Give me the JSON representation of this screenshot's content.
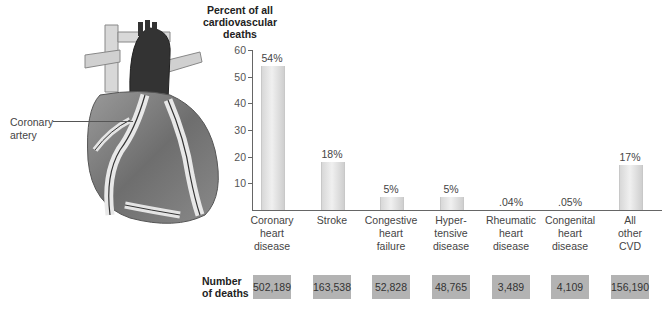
{
  "illustration": {
    "label": "Coronary\nartery",
    "label_line1": "Coronary",
    "label_line2": "artery"
  },
  "y_axis": {
    "title_line1": "Percent of all",
    "title_line2": "cardiovascular",
    "title_line3": "deaths",
    "ticks": [
      "10",
      "20",
      "30",
      "40",
      "50",
      "60"
    ]
  },
  "bars": [
    {
      "label_lines": [
        "Coronary",
        "heart",
        "disease"
      ],
      "value_label": "54%",
      "deaths": "502,189"
    },
    {
      "label_lines": [
        "Stroke"
      ],
      "value_label": "18%",
      "deaths": "163,538"
    },
    {
      "label_lines": [
        "Congestive",
        "heart",
        "failure"
      ],
      "value_label": "5%",
      "deaths": "52,828"
    },
    {
      "label_lines": [
        "Hyper-",
        "tensive",
        "disease"
      ],
      "value_label": "5%",
      "deaths": "48,765"
    },
    {
      "label_lines": [
        "Rheumatic",
        "heart",
        "disease"
      ],
      "value_label": ".04%",
      "deaths": "3,489"
    },
    {
      "label_lines": [
        "Congenital",
        "heart",
        "disease"
      ],
      "value_label": ".05%",
      "deaths": "4,109"
    },
    {
      "label_lines": [
        "All",
        "other",
        "CVD"
      ],
      "value_label": "17%",
      "deaths": "156,190"
    }
  ],
  "number_of_deaths": {
    "title_line1": "Number",
    "title_line2": "of deaths"
  },
  "chart_data": {
    "type": "bar",
    "title": "",
    "xlabel": "",
    "ylabel": "Percent of all cardiovascular deaths",
    "ylim": [
      0,
      60
    ],
    "yticks": [
      10,
      20,
      30,
      40,
      50,
      60
    ],
    "grid": false,
    "legend": null,
    "categories": [
      "Coronary heart disease",
      "Stroke",
      "Congestive heart failure",
      "Hypertensive disease",
      "Rheumatic heart disease",
      "Congenital heart disease",
      "All other CVD"
    ],
    "values": [
      54,
      18,
      5,
      5,
      0.04,
      0.05,
      17
    ],
    "data_labels": [
      "54%",
      "18%",
      "5%",
      "5%",
      ".04%",
      ".05%",
      "17%"
    ],
    "secondary_table": {
      "row_label": "Number of deaths",
      "values": [
        502189,
        163538,
        52828,
        48765,
        3489,
        4109,
        156190
      ]
    },
    "annotations": [
      "Coronary artery (heart illustration)"
    ]
  },
  "colors": {
    "bar": "#e2e2e2",
    "axis": "#666666",
    "deaths_box": "#b3b3b3"
  }
}
